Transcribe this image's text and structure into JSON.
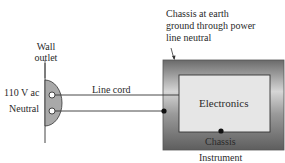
{
  "diagram": {
    "wall_outlet_label_line1": "Wall",
    "wall_outlet_label_line2": "outlet",
    "hot_label": "110 V ac",
    "neutral_label": "Neutral",
    "line_cord_label": "Line cord",
    "chassis_note_line1": "Chassis at earth",
    "chassis_note_line2": "ground through power",
    "chassis_note_line3": "line neutral",
    "electronics_label": "Electronics",
    "chassis_label": "Chassis",
    "instrument_label": "Instrument"
  },
  "colors": {
    "line": "#333333",
    "outlet_fill": "#a8a8a8",
    "chassis_dark": "#6e6e6e",
    "chassis_light": "#c8c8c8",
    "electronics_fill": "#e8e8e8"
  }
}
